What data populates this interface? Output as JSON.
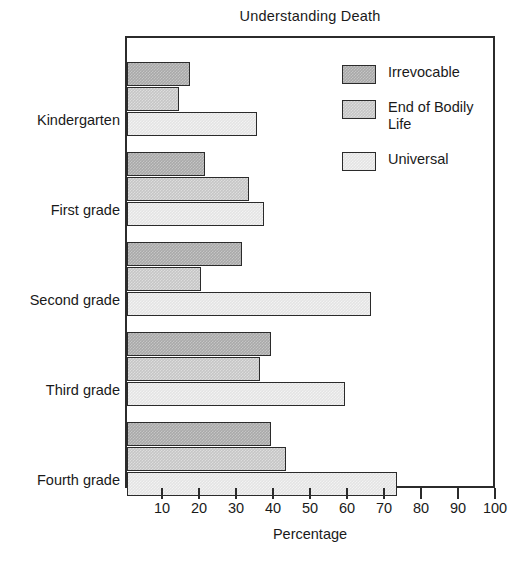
{
  "chart_data": {
    "type": "bar",
    "orientation": "horizontal",
    "title": "Understanding Death",
    "xlabel": "Percentage",
    "ylabel": "",
    "xlim": [
      0,
      100
    ],
    "xticks": [
      10,
      20,
      30,
      40,
      50,
      60,
      70,
      80,
      90,
      100
    ],
    "grid": false,
    "legend_position": "top-right inside plot",
    "categories": [
      "Kindergarten",
      "First grade",
      "Second grade",
      "Third grade",
      "Fourth grade"
    ],
    "series": [
      {
        "name": "Irrevocable",
        "color": "#a9a9a9",
        "values": [
          17,
          21,
          31,
          39,
          39
        ]
      },
      {
        "name": "End of Bodily Life",
        "color": "#c6c6c6",
        "values": [
          14,
          33,
          20,
          36,
          43
        ]
      },
      {
        "name": "Universal",
        "color": "#e4e4e4",
        "values": [
          35,
          37,
          66,
          59,
          73
        ]
      }
    ]
  },
  "legend": {
    "entries": [
      {
        "label": "Irrevocable"
      },
      {
        "label": "End of Bodily\nLife"
      },
      {
        "label": "Universal"
      }
    ]
  }
}
